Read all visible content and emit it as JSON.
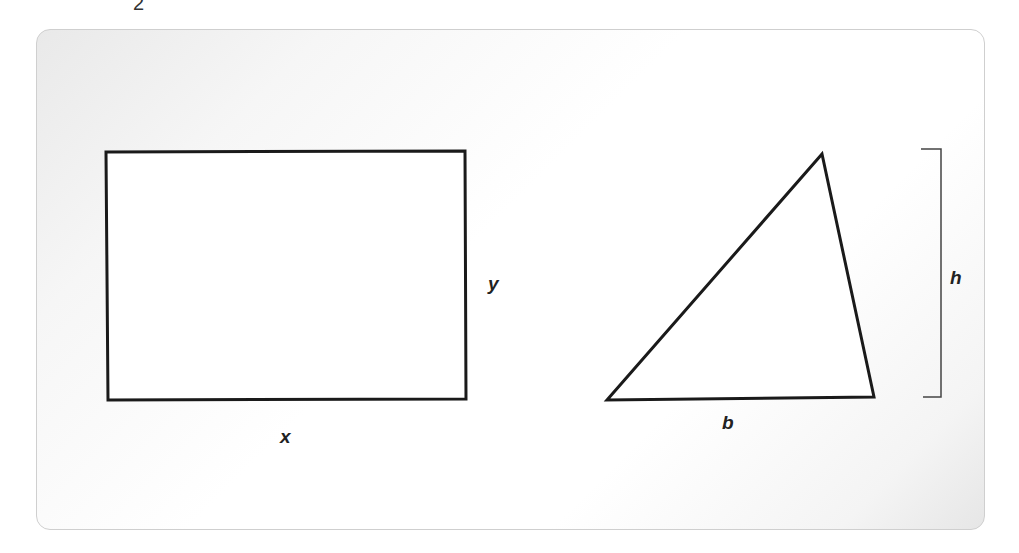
{
  "page_number": "2",
  "figure": {
    "rectangle": {
      "width_label": "x",
      "height_label": "y"
    },
    "triangle": {
      "base_label": "b",
      "height_label": "h"
    },
    "colors": {
      "stroke": "#1a1a1a",
      "panel_background": "#f2f2f2"
    }
  }
}
